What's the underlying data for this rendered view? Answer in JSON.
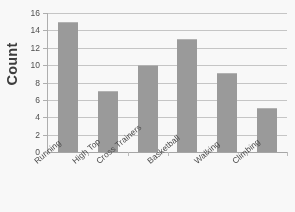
{
  "chart_data": {
    "type": "bar",
    "title": "",
    "xlabel": "",
    "ylabel": "Count",
    "categories": [
      "Running",
      "High Top",
      "Cross Trainers",
      "Basketball",
      "Walking",
      "Climbing"
    ],
    "values": [
      15,
      7,
      10,
      13,
      9.1,
      5.1
    ],
    "ylim": [
      0,
      16
    ],
    "ytick_labels": [
      "16",
      "14",
      "12",
      "10",
      "8",
      "6",
      "4",
      "2",
      "0"
    ],
    "ytick_values": [
      16,
      14,
      12,
      10,
      8,
      6,
      4,
      2,
      0
    ],
    "grid": true,
    "legend": false,
    "bar_color": "#9b9b9b",
    "grid_color": "#c8c8c8",
    "axis_color": "#b0b0b0",
    "text_color": "#4a4a4a",
    "background_color": "#fdfdfd"
  }
}
